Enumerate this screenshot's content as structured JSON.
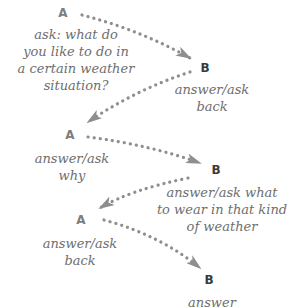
{
  "diagram": {
    "colors": {
      "speaker_a": "#7d7d7d",
      "speaker_b": "#3a3a3a",
      "caption_text": "#6e6e6e",
      "arrow": "#8e8e8e"
    },
    "steps": [
      {
        "speaker": "A",
        "lines": [
          "ask: what do",
          "you like to do in",
          "a certain weather",
          "situation?"
        ]
      },
      {
        "speaker": "B",
        "lines": [
          "answer/ask",
          "back"
        ]
      },
      {
        "speaker": "A",
        "lines": [
          "answer/ask",
          "why"
        ]
      },
      {
        "speaker": "B",
        "lines": [
          "answer/ask what",
          "to wear in that kind",
          "of weather"
        ]
      },
      {
        "speaker": "A",
        "lines": [
          "answer/ask",
          "back"
        ]
      },
      {
        "speaker": "B",
        "lines": [
          "answer"
        ]
      }
    ]
  }
}
